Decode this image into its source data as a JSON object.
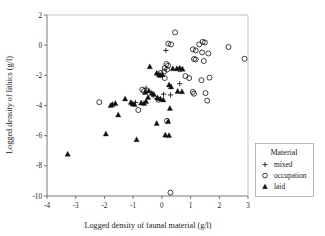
{
  "chart_data": {
    "type": "scatter",
    "title": "",
    "xlabel": "Logged density of faunal material (g/l)",
    "ylabel": "Logged density of lithics (g/l)",
    "xlim": [
      -4,
      3
    ],
    "ylim": [
      -10,
      2
    ],
    "xticks": [
      -4,
      -3,
      -2,
      -1,
      0,
      1,
      2,
      3
    ],
    "yticks": [
      2,
      0,
      -2,
      -4,
      -6,
      -8,
      -10
    ],
    "xtick_labels": [
      "-4",
      "-3",
      "-2",
      "-1",
      "0",
      "1",
      "2",
      "3"
    ],
    "ytick_labels": [
      "2",
      "0",
      "-2",
      "-4",
      "-6",
      "-8",
      "-10"
    ],
    "grid": false,
    "legend": {
      "title": "Material",
      "position": "right-outside",
      "entries": [
        {
          "label": "mixed",
          "marker": "plus"
        },
        {
          "label": "occupation",
          "marker": "open-circle"
        },
        {
          "label": "laid",
          "marker": "filled-triangle"
        }
      ]
    },
    "series": [
      {
        "name": "mixed",
        "marker": "plus",
        "points": [
          [
            0.14,
            -0.35
          ],
          [
            -0.55,
            -2.85
          ],
          [
            0.62,
            -2.55
          ],
          [
            -0.18,
            -3.55
          ],
          [
            -0.92,
            -3.8
          ],
          [
            0.06,
            -3.25
          ],
          [
            -0.3,
            -3.35
          ],
          [
            0.3,
            -3.3
          ]
        ]
      },
      {
        "name": "occupation",
        "marker": "open-circle",
        "points": [
          [
            0.46,
            0.85
          ],
          [
            0.22,
            0.1
          ],
          [
            0.32,
            0.05
          ],
          [
            1.42,
            0.22
          ],
          [
            1.5,
            0.18
          ],
          [
            1.3,
            0.05
          ],
          [
            2.32,
            -0.12
          ],
          [
            1.08,
            -0.28
          ],
          [
            1.18,
            -0.35
          ],
          [
            1.4,
            -0.48
          ],
          [
            1.62,
            -0.55
          ],
          [
            2.88,
            -0.9
          ],
          [
            1.12,
            -0.92
          ],
          [
            1.18,
            -0.95
          ],
          [
            1.46,
            -1.05
          ],
          [
            0.16,
            -1.25
          ],
          [
            0.22,
            -1.35
          ],
          [
            0.1,
            -1.52
          ],
          [
            0.18,
            -1.62
          ],
          [
            0.08,
            -1.75
          ],
          [
            -0.05,
            -1.85
          ],
          [
            0.62,
            -1.6
          ],
          [
            0.1,
            -2.18
          ],
          [
            0.82,
            -2.05
          ],
          [
            0.95,
            -2.18
          ],
          [
            1.38,
            -2.32
          ],
          [
            1.66,
            -2.15
          ],
          [
            -0.68,
            -2.95
          ],
          [
            -0.62,
            -3.05
          ],
          [
            1.08,
            -3.1
          ],
          [
            1.12,
            -3.22
          ],
          [
            1.52,
            -3.18
          ],
          [
            -0.12,
            -3.62
          ],
          [
            1.58,
            -3.68
          ],
          [
            -2.18,
            -3.78
          ],
          [
            -0.82,
            -4.3
          ],
          [
            0.18,
            -5.02
          ],
          [
            0.3,
            -9.78
          ]
        ]
      },
      {
        "name": "laid",
        "marker": "filled-triangle",
        "points": [
          [
            -0.42,
            -1.42
          ],
          [
            -0.18,
            -1.85
          ],
          [
            -0.1,
            -1.95
          ],
          [
            -0.05,
            -2.0
          ],
          [
            0.02,
            -1.95
          ],
          [
            0.52,
            -1.55
          ],
          [
            0.62,
            -1.52
          ],
          [
            0.72,
            -1.58
          ],
          [
            0.38,
            -1.55
          ],
          [
            0.25,
            -2.62
          ],
          [
            0.32,
            -2.75
          ],
          [
            0.55,
            -3.05
          ],
          [
            0.7,
            -3.08
          ],
          [
            -0.45,
            -3.02
          ],
          [
            -0.58,
            -3.12
          ],
          [
            -0.35,
            -3.18
          ],
          [
            -0.28,
            -3.25
          ],
          [
            -0.48,
            -3.45
          ],
          [
            -0.15,
            -3.48
          ],
          [
            -0.05,
            -3.55
          ],
          [
            0.05,
            -3.62
          ],
          [
            -1.08,
            -3.78
          ],
          [
            -1.02,
            -3.88
          ],
          [
            -0.95,
            -3.92
          ],
          [
            -0.72,
            -3.82
          ],
          [
            -0.62,
            -3.85
          ],
          [
            -1.62,
            -3.85
          ],
          [
            -1.72,
            -3.92
          ],
          [
            -1.78,
            -3.98
          ],
          [
            -1.52,
            -4.62
          ],
          [
            -0.88,
            -6.25
          ],
          [
            -1.95,
            -5.88
          ],
          [
            -0.18,
            -5.18
          ],
          [
            0.22,
            -5.05
          ],
          [
            0.12,
            -5.95
          ],
          [
            0.25,
            -5.98
          ],
          [
            0.28,
            -4.18
          ],
          [
            -3.28,
            -7.22
          ],
          [
            -1.28,
            -3.55
          ],
          [
            -0.55,
            -3.72
          ]
        ]
      }
    ]
  }
}
